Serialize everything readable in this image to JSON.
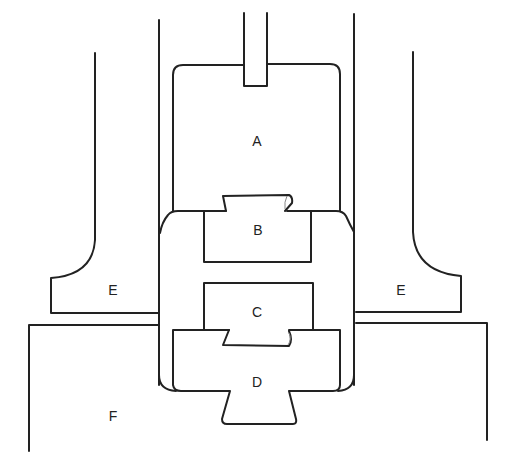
{
  "diagram": {
    "type": "mechanical cross-section",
    "colors": {
      "stroke": "#222222",
      "background": "#ffffff"
    },
    "labels": [
      {
        "id": "A",
        "text": "A",
        "x": 257,
        "y": 141
      },
      {
        "id": "B",
        "text": "B",
        "x": 257,
        "y": 230
      },
      {
        "id": "C",
        "text": "C",
        "x": 257,
        "y": 312
      },
      {
        "id": "D",
        "text": "D",
        "x": 257,
        "y": 382
      },
      {
        "id": "E_left",
        "text": "E",
        "x": 113,
        "y": 290
      },
      {
        "id": "E_right",
        "text": "E",
        "x": 401,
        "y": 290
      },
      {
        "id": "F",
        "text": "F",
        "x": 113,
        "y": 416
      }
    ]
  }
}
